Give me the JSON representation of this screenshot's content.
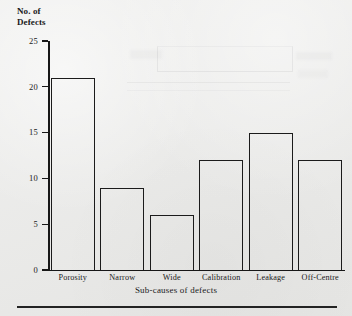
{
  "chart_data": {
    "type": "bar",
    "title": "",
    "xlabel": "Sub-causes of defects",
    "ylabel": "No. of Defects",
    "ylabel_lines": [
      "No. of",
      "Defects"
    ],
    "categories": [
      "Porosity",
      "Narrow",
      "Wide",
      "Calibration",
      "Leakage",
      "Off-Centre"
    ],
    "values": [
      21,
      9,
      6,
      12,
      15,
      12
    ],
    "ylim": [
      0,
      25
    ],
    "yticks": [
      0,
      5,
      10,
      15,
      20,
      25
    ],
    "ytick_labels": [
      "0",
      "5",
      "10",
      "15",
      "20",
      "25"
    ],
    "grid": false,
    "legend": false,
    "bar_style": {
      "fill": "none",
      "outline_color": "#1b1b1b"
    }
  },
  "figure": {
    "background_color": "#e9e9e7",
    "ink_color": "#1a1a1a",
    "axis_color": "#171717",
    "footer_rule_color": "#232323"
  }
}
